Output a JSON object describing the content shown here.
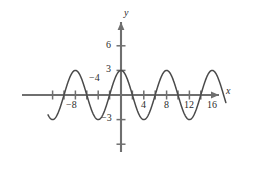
{
  "figure": {
    "axis_labels": {
      "x": "x",
      "y": "y"
    },
    "x_tick_labels": [
      "−8",
      "−4",
      "4",
      "8",
      "12",
      "16"
    ],
    "y_tick_labels": [
      "6",
      "3",
      "−3"
    ],
    "colors": {
      "axis": "#6f6f6f",
      "curve": "#4a4a4a",
      "text": "#2b2b2b",
      "background": "#ffffff"
    }
  },
  "chart_data": {
    "type": "line",
    "title": "",
    "xlabel": "x",
    "ylabel": "y",
    "xlim": [
      -12.8,
      18.4
    ],
    "ylim": [
      -7.6,
      7.8
    ],
    "grid": false,
    "legend": null,
    "function": "y = 3 cos(pi*x/4)",
    "amplitude": 3,
    "period": 8,
    "phase_shift": 0,
    "vertical_shift": 0,
    "x_ticks": [
      -12,
      -10,
      -8,
      -6,
      -4,
      -2,
      2,
      4,
      6,
      8,
      10,
      12,
      14,
      16
    ],
    "x_ticks_labeled": [
      -8,
      -4,
      4,
      8,
      12,
      16
    ],
    "x_tick_labels": [
      "−8",
      "−4",
      "4",
      "8",
      "12",
      "16"
    ],
    "y_ticks": [
      -6,
      -3,
      3,
      6
    ],
    "y_ticks_labeled": [
      -3,
      3,
      6
    ],
    "y_tick_labels": [
      "−3",
      "3",
      "6"
    ],
    "maxima_x": [
      -16,
      -8,
      0,
      8,
      16
    ],
    "minima_x": [
      -12,
      -4,
      4,
      12
    ],
    "maxima_y": 3,
    "minima_y": -3,
    "zeros_x": [
      -14,
      -10,
      -6,
      -2,
      2,
      6,
      10,
      14
    ],
    "series": [
      {
        "name": "y = 3 cos(pi*x/4)",
        "x": [
          -12.6,
          -12.0,
          -11.4,
          -10.8,
          -10.2,
          -9.6,
          -9.0,
          -8.4,
          -7.8,
          -7.2,
          -6.6,
          -6.0,
          -5.4,
          -4.8,
          -4.2,
          -3.6,
          -3.0,
          -2.4,
          -1.8,
          -1.2,
          -0.6,
          0.0,
          0.6,
          1.2,
          1.8,
          2.4,
          3.0,
          3.6,
          4.2,
          4.8,
          5.4,
          6.0,
          6.6,
          7.2,
          7.8,
          8.4,
          9.0,
          9.6,
          10.2,
          10.8,
          11.4,
          12.0,
          12.6,
          13.2,
          13.8,
          14.4,
          15.0,
          15.6,
          16.2,
          16.8,
          17.4
        ],
        "y": [
          -2.72,
          -3.0,
          -2.72,
          -1.93,
          -0.78,
          0.47,
          1.62,
          2.54,
          2.96,
          2.83,
          2.18,
          1.15,
          -0.08,
          -1.28,
          -2.22,
          -2.78,
          -2.9,
          -2.54,
          -1.76,
          -0.71,
          0.47,
          3.0,
          2.87,
          2.54,
          1.76,
          0.71,
          -0.47,
          -1.62,
          -2.54,
          -2.96,
          -2.83,
          -2.18,
          -1.15,
          0.08,
          1.28,
          2.22,
          2.78,
          2.9,
          2.54,
          1.76,
          0.71,
          -0.47,
          -1.62,
          -2.54,
          -2.96,
          -2.83,
          -2.18,
          -1.15,
          0.08,
          1.28,
          2.22
        ]
      }
    ]
  }
}
